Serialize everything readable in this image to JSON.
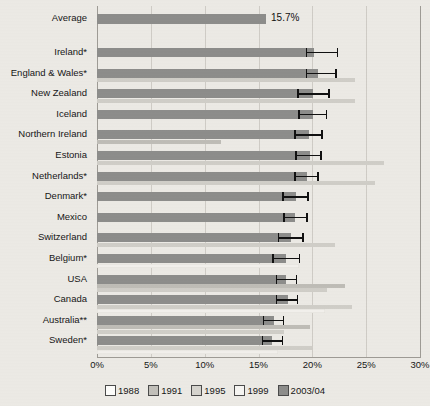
{
  "chart_data": {
    "type": "bar",
    "orientation": "horizontal",
    "title": "",
    "xlabel": "",
    "ylabel": "",
    "xlim": [
      0,
      30
    ],
    "xticks": [
      "0%",
      "5%",
      "10%",
      "15%",
      "20%",
      "25%",
      "30%"
    ],
    "xtick_values": [
      0,
      5,
      10,
      15,
      20,
      25,
      30
    ],
    "grid": true,
    "legend_position": "bottom",
    "legend": [
      "1988",
      "1991",
      "1995",
      "1999",
      "2003/04"
    ],
    "series_colors": {
      "1988": "#fdfdfb",
      "1991": "#c2c0ba",
      "1995": "#d6d4ce",
      "1999": "#f6f5f2",
      "2003/04": "#8d8d8b"
    },
    "summary_row": {
      "label": "Average",
      "value": 15.7,
      "value_label": "15.7%"
    },
    "categories": [
      "Ireland*",
      "England & Wales*",
      "New Zealand",
      "Iceland",
      "Northern Ireland",
      "Estonia",
      "Netherlands*",
      "Denmark*",
      "Mexico",
      "Switzerland",
      "Belgium*",
      "USA",
      "Canada",
      "Australia**",
      "Sweden*"
    ],
    "rows": [
      {
        "label": "Ireland*",
        "v1988": null,
        "v1991": null,
        "v1995": null,
        "v1999": null,
        "v2003": 20.2,
        "err_low": 19.4,
        "err_high": 22.4
      },
      {
        "label": "England & Wales*",
        "v1988": null,
        "v1991": null,
        "v1995": 24.0,
        "v1999": null,
        "v2003": 20.5,
        "err_low": 19.4,
        "err_high": 22.3
      },
      {
        "label": "New Zealand",
        "v1988": null,
        "v1991": null,
        "v1995": 24.0,
        "v1999": null,
        "v2003": 20.1,
        "err_low": 18.6,
        "err_high": 21.6
      },
      {
        "label": "Iceland",
        "v1988": null,
        "v1991": null,
        "v1995": null,
        "v1999": null,
        "v2003": 20.1,
        "err_low": 18.7,
        "err_high": 21.4
      },
      {
        "label": "Northern Ireland",
        "v1988": null,
        "v1991": 11.5,
        "v1995": null,
        "v1999": null,
        "v2003": 19.7,
        "err_low": 18.3,
        "err_high": 21.0
      },
      {
        "label": "Estonia",
        "v1988": null,
        "v1991": null,
        "v1995": 26.7,
        "v1999": null,
        "v2003": 19.8,
        "err_low": 18.4,
        "err_high": 20.9
      },
      {
        "label": "Netherlands*",
        "v1988": null,
        "v1991": null,
        "v1995": 25.8,
        "v1999": null,
        "v2003": 19.5,
        "err_low": 18.3,
        "err_high": 20.6
      },
      {
        "label": "Denmark*",
        "v1988": null,
        "v1991": null,
        "v1995": null,
        "v1999": null,
        "v2003": 18.5,
        "err_low": 17.2,
        "err_high": 19.7
      },
      {
        "label": "Mexico",
        "v1988": null,
        "v1991": null,
        "v1995": null,
        "v1999": null,
        "v2003": 18.4,
        "err_low": 17.3,
        "err_high": 19.6
      },
      {
        "label": "Switzerland",
        "v1988": null,
        "v1991": null,
        "v1995": 22.1,
        "v1999": null,
        "v2003": 18.0,
        "err_low": 16.8,
        "err_high": 19.2
      },
      {
        "label": "Belgium*",
        "v1988": null,
        "v1991": null,
        "v1995": null,
        "v1999": 18.8,
        "v2003": 17.6,
        "err_low": 16.3,
        "err_high": 18.9
      },
      {
        "label": "USA",
        "v1988": null,
        "v1991": 23.0,
        "v1995": 21.4,
        "v1999": null,
        "v2003": 17.6,
        "err_low": 16.6,
        "err_high": 18.6
      },
      {
        "label": "Canada",
        "v1988": null,
        "v1991": null,
        "v1995": 23.7,
        "v1999": 21.2,
        "v2003": 17.7,
        "err_low": 16.6,
        "err_high": 18.7
      },
      {
        "label": "Australia**",
        "v1988": null,
        "v1991": 19.8,
        "v1995": 17.4,
        "v1999": null,
        "v2003": 16.4,
        "err_low": 15.4,
        "err_high": 17.4
      },
      {
        "label": "Sweden*",
        "v1988": null,
        "v1991": null,
        "v1995": 20.0,
        "v1999": 16.8,
        "v2003": 16.3,
        "err_low": 15.3,
        "err_high": 17.3
      }
    ]
  }
}
